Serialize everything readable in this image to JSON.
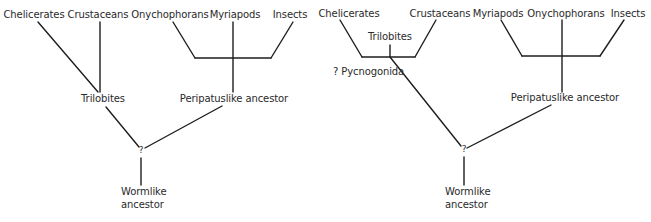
{
  "figure": {
    "left_tree": {
      "taxa": [
        "Chelicerates",
        "Crustaceans",
        "Onychophorans",
        "Myriapods",
        "Insects"
      ],
      "nodes": {
        "trilobites": "Trilobites",
        "peripatuslike": "Peripatuslike ancestor",
        "unknown": "?",
        "root_line1": "Wormlike",
        "root_line2": "ancestor"
      }
    },
    "right_tree": {
      "taxa": [
        "Chelicerates",
        "Crustaceans",
        "Myriapods",
        "Onychophorans",
        "Insects"
      ],
      "nodes": {
        "trilobites": "Trilobites",
        "pycnogonida": "? Pycnogonida",
        "peripatuslike": "Peripatuslike ancestor",
        "unknown": "?",
        "root_line1": "Wormlike",
        "root_line2": "ancestor"
      }
    },
    "line_color": "#1e1e1e",
    "text_color": "#2a2a2a"
  }
}
